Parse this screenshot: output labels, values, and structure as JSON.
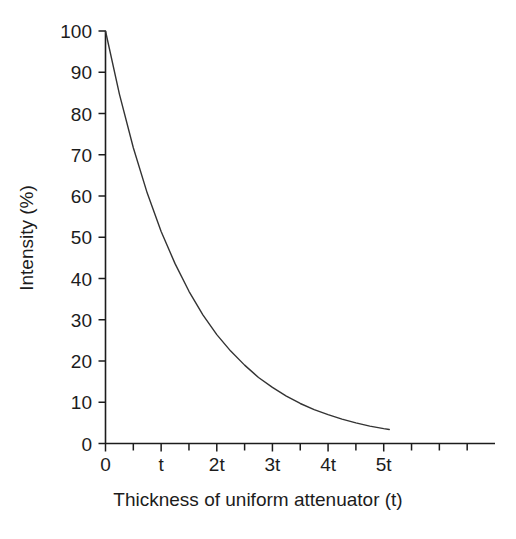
{
  "chart_data": {
    "type": "line",
    "title": "",
    "xlabel": "Thickness of uniform attenuator (t)",
    "ylabel": "Intensity (%)",
    "xlim": [
      0,
      7
    ],
    "ylim": [
      0,
      100
    ],
    "grid": false,
    "legend": "none",
    "x_tick_labels": [
      "0",
      "t",
      "2t",
      "3t",
      "4t",
      "5t"
    ],
    "x_tick_values": [
      0,
      1,
      2,
      3,
      4,
      5
    ],
    "x_minor_ticks": [
      0.5,
      1.5,
      2.5,
      3.5,
      4.5,
      5.5,
      6,
      6.5
    ],
    "y_tick_labels": [
      "0",
      "10",
      "20",
      "30",
      "40",
      "50",
      "60",
      "70",
      "80",
      "90",
      "100"
    ],
    "y_tick_values": [
      0,
      10,
      20,
      30,
      40,
      50,
      60,
      70,
      80,
      90,
      100
    ],
    "series": [
      {
        "name": "Transmitted intensity",
        "color": "#333333",
        "equation": "I = 100 * exp(-0.665 * x)",
        "x": [
          0,
          0.25,
          0.5,
          0.75,
          1,
          1.25,
          1.5,
          1.75,
          2,
          2.25,
          2.5,
          2.75,
          3,
          3.25,
          3.5,
          3.75,
          4,
          4.25,
          4.5,
          4.75,
          5,
          5.1
        ],
        "values": [
          100,
          84.7,
          71.7,
          60.7,
          51.4,
          43.6,
          36.9,
          31.2,
          26.4,
          22.4,
          19.0,
          16.0,
          13.6,
          11.5,
          9.7,
          8.2,
          7.0,
          5.9,
          5.0,
          4.2,
          3.6,
          3.4
        ]
      }
    ]
  },
  "axes": {
    "tick_color": "#1c1c1c",
    "axis_color": "#1c1c1c",
    "background": "#ffffff"
  }
}
